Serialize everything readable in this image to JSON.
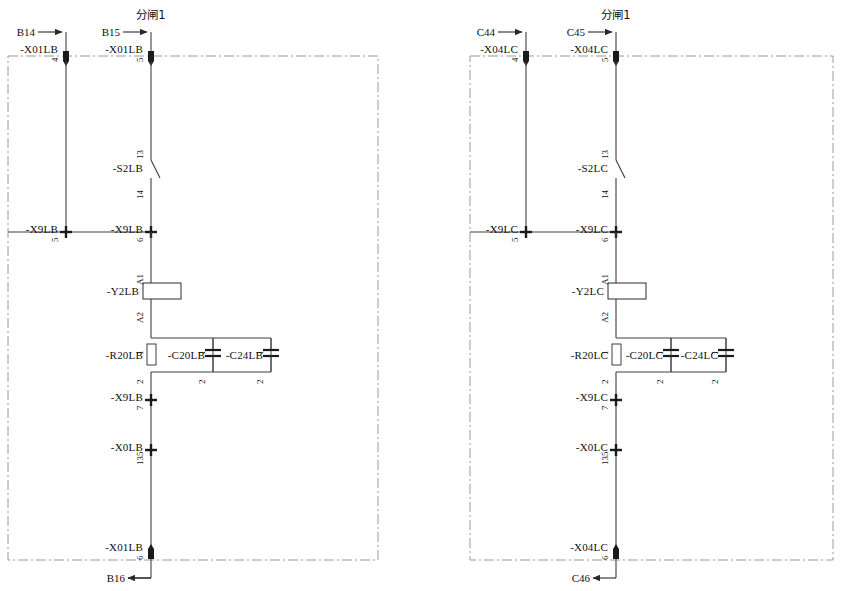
{
  "sheet": {
    "width": 845,
    "height": 591,
    "background": "#ffffff",
    "line_color": "#3f3f3f",
    "boundary_color": "#9a9a9a",
    "text_color": "#101010"
  },
  "circuits": [
    {
      "id": "circuit-lb",
      "title": "分闸1",
      "suffix": "LB",
      "source_in_left": "B14",
      "source_in_right": "B15",
      "source_out": "B16",
      "terminal_top_left": {
        "label": "-X01LB",
        "number": "4"
      },
      "terminal_top_right": {
        "label": "-X01LB",
        "number": "5"
      },
      "switch": {
        "label": "-S2LB",
        "terminal_top": "13",
        "terminal_bottom": "14"
      },
      "terminal_mid_left": {
        "label": "-X9LB",
        "number": "5"
      },
      "terminal_mid_right": {
        "label": "-X9LB",
        "number": "6"
      },
      "coil": {
        "label": "-Y2LB",
        "terminal_top": "A1",
        "terminal_bottom": "A2"
      },
      "resistor": {
        "label": "-R20LB",
        "terminal_top": "1",
        "terminal_bottom": "2"
      },
      "capacitor_1": {
        "label": "-C20LB",
        "terminal_top": "1",
        "terminal_bottom": "2"
      },
      "capacitor_2": {
        "label": "-C24LB",
        "terminal_top": "1",
        "terminal_bottom": "2"
      },
      "terminal_low_1": {
        "label": "-X9LB",
        "number": "7"
      },
      "terminal_low_2": {
        "label": "-X0LB",
        "number": "135"
      },
      "terminal_bottom": {
        "label": "-X01LB",
        "number": "6"
      }
    },
    {
      "id": "circuit-lc",
      "title": "分闸1",
      "suffix": "LC",
      "source_in_left": "C44",
      "source_in_right": "C45",
      "source_out": "C46",
      "terminal_top_left": {
        "label": "-X04LC",
        "number": "4"
      },
      "terminal_top_right": {
        "label": "-X04LC",
        "number": "5"
      },
      "switch": {
        "label": "-S2LC",
        "terminal_top": "13",
        "terminal_bottom": "14"
      },
      "terminal_mid_left": {
        "label": "-X9LC",
        "number": "5"
      },
      "terminal_mid_right": {
        "label": "-X9LC",
        "number": "6"
      },
      "coil": {
        "label": "-Y2LC",
        "terminal_top": "A1",
        "terminal_bottom": "A2"
      },
      "resistor": {
        "label": "-R20LC",
        "terminal_top": "1",
        "terminal_bottom": "2"
      },
      "capacitor_1": {
        "label": "-C20LC",
        "terminal_top": "1",
        "terminal_bottom": "2"
      },
      "capacitor_2": {
        "label": "-C24LC",
        "terminal_top": "1",
        "terminal_bottom": "2"
      },
      "terminal_low_1": {
        "label": "-X9LC",
        "number": "7"
      },
      "terminal_low_2": {
        "label": "-X0LC",
        "number": "135"
      },
      "terminal_bottom": {
        "label": "-X04LC",
        "number": "6"
      }
    }
  ]
}
